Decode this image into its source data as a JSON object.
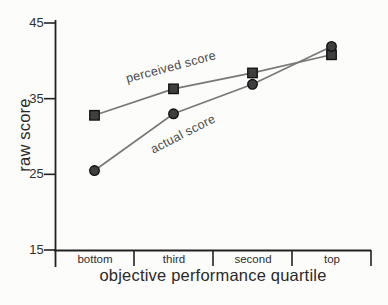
{
  "chart_data": {
    "type": "line",
    "title": "",
    "xlabel": "objective performance quartile",
    "ylabel": "raw score",
    "categories": [
      "bottom",
      "third",
      "second",
      "top"
    ],
    "y_ticks": [
      45,
      35,
      25,
      15
    ],
    "ylim": [
      15,
      45
    ],
    "grid": false,
    "legend_position": "inline-labels-on-lines",
    "series": [
      {
        "name": "perceived score",
        "marker": "square",
        "values": [
          32.8,
          36.3,
          38.4,
          40.8
        ]
      },
      {
        "name": "actual score",
        "marker": "circle",
        "values": [
          25.5,
          33.0,
          36.9,
          41.9
        ]
      }
    ],
    "colors": {
      "line": "#787878",
      "marker_fill": "#3f3f3f",
      "marker_stroke": "#101010",
      "axis": "#222222",
      "tick_label": "#2e2e2e",
      "series_label": "#4a4a4a",
      "background": "#fcfcfa"
    }
  }
}
